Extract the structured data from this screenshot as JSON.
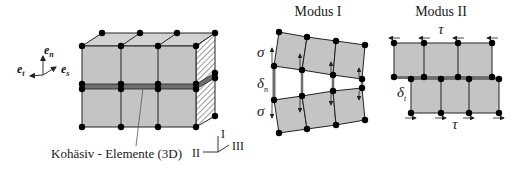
{
  "figure": {
    "left": {
      "caption": "Kohäsiv - Elemente (3D)",
      "basis_vectors": {
        "n": {
          "base": "e",
          "sub": "n"
        },
        "t": {
          "base": "e",
          "sub": "t"
        },
        "s": {
          "base": "e",
          "sub": "s"
        }
      },
      "mode_axes": {
        "I": "I",
        "II": "II",
        "III": "III"
      }
    },
    "mode1": {
      "title": "Modus I",
      "stress_label": "σ",
      "separation_label": "δ",
      "separation_sub": "n"
    },
    "mode2": {
      "title": "Modus II",
      "stress_label": "τ",
      "separation_label": "δ",
      "separation_sub": "t"
    }
  },
  "colors": {
    "element_fill": "#c4c4c4",
    "cohesive_band": "#6e6e6e",
    "line": "#222222",
    "node": "#000000"
  }
}
